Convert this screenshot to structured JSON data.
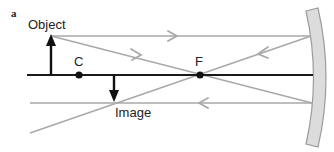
{
  "figure": {
    "panel_label": "a",
    "labels": {
      "object": "Object",
      "image": "Image",
      "center": "C",
      "focus": "F"
    },
    "colors": {
      "axis": "#1a1a1a",
      "ray": "#a9a9a9",
      "mirror_fill": "#dcdcdc",
      "mirror_stroke": "#9c9c9c",
      "arrow": "#111111",
      "background": "#ffffff"
    },
    "elements": {
      "mirror": "concave-mirror",
      "optical_axis": "principal-axis",
      "object_arrow": "upright",
      "image_arrow": "inverted"
    }
  }
}
